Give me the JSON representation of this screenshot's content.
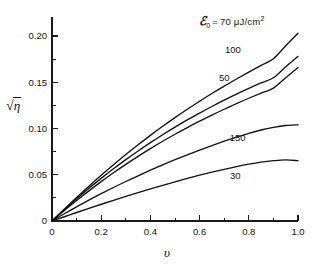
{
  "figure": {
    "background_color": "#ffffff",
    "line_color": "#111111",
    "width": 311,
    "height": 267
  },
  "axis_titles": {
    "y_prefix": "√",
    "y_radicand": "η",
    "y_full": "√η",
    "x_full": "υ"
  },
  "legend": {
    "symbol": "ℰ",
    "subscript": "0",
    "equals": "=",
    "value": "70",
    "unit_prefix": "μJ/cm",
    "unit_exponent": "2",
    "full_text": "ℰ0 = 70 μJ/cm2"
  },
  "chart_data": {
    "type": "line",
    "title": "",
    "subtitle": "",
    "xlabel": "υ",
    "ylabel": "√η",
    "xlim": [
      0,
      1.0
    ],
    "ylim": [
      0,
      0.225
    ],
    "grid": false,
    "legend_position": "inline-curve-labels",
    "legend_header": "ℰ₀ = 70 μJ/cm²",
    "x_ticks_major": [
      0,
      0.2,
      0.4,
      0.6,
      0.8,
      1.0
    ],
    "x_tick_labels": [
      "0",
      "0.2",
      "0.4",
      "0.6",
      "0.8",
      "1.0"
    ],
    "x_ticks_minor": [
      0.1,
      0.3,
      0.5,
      0.7,
      0.9
    ],
    "y_ticks_major": [
      0,
      0.05,
      0.1,
      0.15,
      0.2
    ],
    "y_tick_labels": [
      "0",
      "0.05",
      "0.10",
      "0.15",
      "0.20"
    ],
    "y_ticks_minor": [
      0.025,
      0.075,
      0.125,
      0.175
    ],
    "x": [
      0,
      0.05,
      0.1,
      0.15,
      0.2,
      0.25,
      0.3,
      0.35,
      0.4,
      0.45,
      0.5,
      0.55,
      0.6,
      0.65,
      0.7,
      0.75,
      0.8,
      0.85,
      0.9,
      0.95,
      1.0
    ],
    "series": [
      {
        "name": "70",
        "label": "70",
        "label_text": "ℰ₀ = 70 μJ/cm²",
        "label_x": 0.78,
        "label_y": 0.218,
        "values": [
          0,
          0.0128,
          0.0254,
          0.0376,
          0.0494,
          0.0608,
          0.0718,
          0.0824,
          0.0926,
          0.1024,
          0.1118,
          0.1208,
          0.1295,
          0.1378,
          0.1458,
          0.1535,
          0.161,
          0.1683,
          0.1754,
          0.1894,
          0.203
        ]
      },
      {
        "name": "100",
        "label": "100",
        "label_x": 0.735,
        "label_y": 0.1855,
        "values": [
          0,
          0.0122,
          0.024,
          0.0353,
          0.0461,
          0.0564,
          0.0663,
          0.0757,
          0.0847,
          0.0933,
          0.1015,
          0.1093,
          0.1167,
          0.1238,
          0.1306,
          0.1371,
          0.1433,
          0.1492,
          0.1549,
          0.1667,
          0.178
        ]
      },
      {
        "name": "50",
        "label": "50",
        "label_x": 0.7,
        "label_y": 0.1555,
        "values": [
          0,
          0.0113,
          0.0222,
          0.0326,
          0.0426,
          0.0521,
          0.0612,
          0.0699,
          0.0782,
          0.0862,
          0.0938,
          0.101,
          0.1079,
          0.1145,
          0.1208,
          0.1269,
          0.1327,
          0.1383,
          0.1437,
          0.1548,
          0.166
        ]
      },
      {
        "name": "150",
        "label": "150",
        "label_x": 0.755,
        "label_y": 0.0905,
        "values": [
          0,
          0.0078,
          0.0153,
          0.0225,
          0.0295,
          0.0362,
          0.0427,
          0.0489,
          0.0549,
          0.0607,
          0.0663,
          0.0716,
          0.0767,
          0.0816,
          0.0863,
          0.0907,
          0.0948,
          0.0984,
          0.1012,
          0.1032,
          0.104
        ]
      },
      {
        "name": "30",
        "label": "30",
        "label_x": 0.745,
        "label_y": 0.0495,
        "values": [
          0,
          0.0046,
          0.0092,
          0.0137,
          0.0181,
          0.0224,
          0.0266,
          0.0307,
          0.0347,
          0.0386,
          0.0424,
          0.046,
          0.0495,
          0.0528,
          0.0559,
          0.0588,
          0.0614,
          0.0636,
          0.0652,
          0.0661,
          0.0652
        ]
      }
    ]
  }
}
